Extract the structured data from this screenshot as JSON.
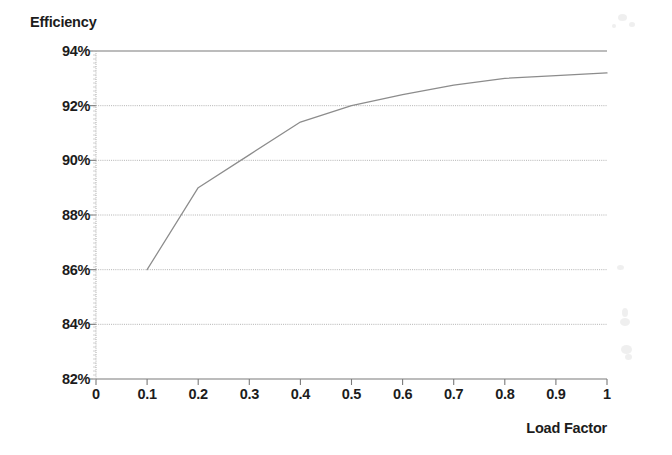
{
  "chart_data": {
    "type": "line",
    "title": "",
    "xlabel": "Load Factor",
    "ylabel": "Efficiency",
    "xlim": [
      0,
      1
    ],
    "ylim": [
      0.82,
      0.94
    ],
    "grid": true,
    "legend": false,
    "x_tick_labels": [
      "0",
      "0.1",
      "0.2",
      "0.3",
      "0.4",
      "0.5",
      "0.6",
      "0.7",
      "0.8",
      "0.9",
      "1"
    ],
    "x_tick_values": [
      0,
      0.1,
      0.2,
      0.3,
      0.4,
      0.5,
      0.6,
      0.7,
      0.8,
      0.9,
      1
    ],
    "y_tick_labels": [
      "94%",
      "92%",
      "90%",
      "88%",
      "86%",
      "84%",
      "82%"
    ],
    "y_tick_values": [
      0.94,
      0.92,
      0.9,
      0.88,
      0.86,
      0.84,
      0.82
    ],
    "series": [
      {
        "name": "Efficiency",
        "color": "#8c8c8c",
        "x": [
          0.1,
          0.2,
          0.3,
          0.4,
          0.5,
          0.6,
          0.7,
          0.8,
          0.9,
          1.0
        ],
        "values": [
          0.86,
          0.89,
          0.902,
          0.914,
          0.92,
          0.924,
          0.9275,
          0.93,
          0.931,
          0.932
        ],
        "values_pct": [
          "86.0%",
          "89.0%",
          "90.2%",
          "91.4%",
          "92.0%",
          "92.4%",
          "92.8%",
          "93.0%",
          "93.1%",
          "93.2%"
        ]
      }
    ]
  },
  "axes": {
    "y_title": "Efficiency",
    "x_title": "Load Factor"
  },
  "colors": {
    "series_line": "#8c8c8c",
    "gridline": "#aaaaaa",
    "axis_line": "#7a7a7a",
    "text": "#1c1c1c",
    "background": "#ffffff"
  }
}
